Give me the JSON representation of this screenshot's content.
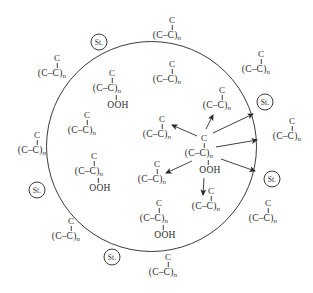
{
  "figure": {
    "width": 313,
    "height": 293,
    "background": "#ffffff",
    "ink": "#2b2b2b",
    "line_color": "#3c3c3c"
  },
  "boundary_circle": {
    "cx": 151.5,
    "cy": 146.5,
    "r": 105
  },
  "labels": {
    "atom": "C",
    "chain_group": "(C–C)",
    "chain_subscript": "n",
    "hydroperoxide": "OOH",
    "styrene": "St."
  },
  "structures": [
    {
      "name": "chain-outside-top",
      "x": 167,
      "y": 36,
      "ooh": false,
      "region": "outside"
    },
    {
      "name": "chain-outside-top-right",
      "x": 256,
      "y": 70,
      "ooh": false,
      "region": "outside"
    },
    {
      "name": "chain-outside-right",
      "x": 287,
      "y": 137,
      "ooh": false,
      "region": "outside"
    },
    {
      "name": "chain-outside-bottom-right",
      "x": 263,
      "y": 219,
      "ooh": false,
      "region": "outside"
    },
    {
      "name": "chain-outside-bottom",
      "x": 163,
      "y": 273,
      "ooh": false,
      "region": "outside"
    },
    {
      "name": "chain-outside-bottom-left",
      "x": 66,
      "y": 237,
      "ooh": false,
      "region": "outside"
    },
    {
      "name": "chain-outside-left",
      "x": 32,
      "y": 151,
      "ooh": false,
      "region": "outside"
    },
    {
      "name": "chain-outside-top-left",
      "x": 52,
      "y": 74,
      "ooh": false,
      "region": "outside"
    },
    {
      "name": "hydroperoxide-inside-upper-left",
      "x": 107,
      "y": 89,
      "ooh": true,
      "region": "inside"
    },
    {
      "name": "chain-inside-top",
      "x": 167,
      "y": 80,
      "ooh": false,
      "region": "inside"
    },
    {
      "name": "chain-inside-left",
      "x": 82,
      "y": 131,
      "ooh": false,
      "region": "inside"
    },
    {
      "name": "chain-inside-upper-middle",
      "x": 157,
      "y": 135,
      "ooh": false,
      "region": "inside"
    },
    {
      "name": "chain-inside-upper-right",
      "x": 217,
      "y": 106,
      "ooh": false,
      "region": "inside"
    },
    {
      "name": "hydroperoxide-inside-lower-left",
      "x": 89,
      "y": 172,
      "ooh": true,
      "region": "inside"
    },
    {
      "name": "chain-inside-lower-middle",
      "x": 152,
      "y": 180,
      "ooh": false,
      "region": "inside"
    },
    {
      "name": "hydroperoxide-inside-bottom",
      "x": 154,
      "y": 219,
      "ooh": true,
      "region": "inside"
    },
    {
      "name": "chain-inside-below-center",
      "x": 206,
      "y": 207,
      "ooh": false,
      "region": "inside"
    },
    {
      "name": "hydroperoxide-center",
      "x": 199,
      "y": 154,
      "ooh": true,
      "region": "inside"
    }
  ],
  "st_labels": [
    {
      "name": "st-label-top",
      "x": 99,
      "y": 42
    },
    {
      "name": "st-label-right-upper",
      "x": 265,
      "y": 102
    },
    {
      "name": "st-label-right-lower",
      "x": 272,
      "y": 179
    },
    {
      "name": "st-label-left",
      "x": 37,
      "y": 190
    },
    {
      "name": "st-label-bottom",
      "x": 112,
      "y": 257
    }
  ],
  "arrows": [
    {
      "x1": 206,
      "y1": 129,
      "x2": 213,
      "y2": 115
    },
    {
      "x1": 197,
      "y1": 136,
      "x2": 172,
      "y2": 125
    },
    {
      "x1": 213,
      "y1": 133,
      "x2": 253,
      "y2": 114
    },
    {
      "x1": 216,
      "y1": 147,
      "x2": 257,
      "y2": 140
    },
    {
      "x1": 221,
      "y1": 159,
      "x2": 255,
      "y2": 171
    },
    {
      "x1": 192,
      "y1": 161,
      "x2": 166,
      "y2": 173
    },
    {
      "x1": 204,
      "y1": 178,
      "x2": 203,
      "y2": 195
    }
  ]
}
